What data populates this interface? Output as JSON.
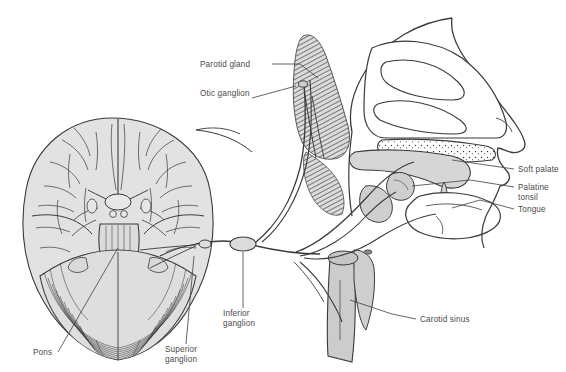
{
  "page": {
    "background_color": "#ffffff",
    "header": {
      "text": "hapter 18 / THE BRAIN AND THE CRANIAL NERVES",
      "color": "#3b3b3b",
      "clipped_left": true
    }
  },
  "figure": {
    "type": "anatomical-illustration",
    "style": "line drawing with gray tone fills and hatching",
    "colors": {
      "outline": "#3a3a3a",
      "brain_fill": "#e2e2e2",
      "tissue_fill": "#d6d6d6",
      "gland_hatch": "#6b6b6b",
      "vessel_fill": "#cccccc",
      "label_text": "#4a4a4a",
      "leader_line": "#4a4a4a"
    },
    "structures": [
      {
        "name": "brain-inferior-view",
        "region": "left"
      },
      {
        "name": "cerebral-hemispheres",
        "region": "left"
      },
      {
        "name": "brainstem",
        "region": "left"
      },
      {
        "name": "cerebellum",
        "region": "left"
      },
      {
        "name": "parotid-gland",
        "region": "center"
      },
      {
        "name": "nasal-cavity",
        "region": "right"
      },
      {
        "name": "nasal-conchae",
        "region": "right"
      },
      {
        "name": "hard-palate",
        "region": "right"
      },
      {
        "name": "soft-palate",
        "region": "right"
      },
      {
        "name": "tongue",
        "region": "right"
      },
      {
        "name": "palatine-tonsil",
        "region": "right"
      },
      {
        "name": "carotid-artery",
        "region": "center-bottom"
      },
      {
        "name": "glossopharyngeal-nerve",
        "region": "center"
      }
    ],
    "labels": [
      {
        "id": "parotid-gland",
        "text": "Parotid gland",
        "lines": [
          "Parotid gland"
        ],
        "x": 200,
        "y": 67,
        "anchor": "start",
        "leader": true
      },
      {
        "id": "otic-ganglion",
        "text": "Otic ganglion",
        "lines": [
          "Otic ganglion"
        ],
        "x": 200,
        "y": 96,
        "anchor": "start",
        "leader": true
      },
      {
        "id": "soft-palate",
        "text": "Soft palate",
        "lines": [
          "Soft palate"
        ],
        "x": 518,
        "y": 172,
        "anchor": "start",
        "leader": true
      },
      {
        "id": "palatine-tonsil",
        "text": "Palatine tonsil",
        "lines": [
          "Palatine",
          "tonsil"
        ],
        "x": 518,
        "y": 190,
        "anchor": "start",
        "leader": true
      },
      {
        "id": "tongue",
        "text": "Tongue",
        "lines": [
          "Tongue"
        ],
        "x": 518,
        "y": 212,
        "anchor": "start",
        "leader": true
      },
      {
        "id": "carotid-sinus",
        "text": "Carotid sinus",
        "lines": [
          "Carotid sinus"
        ],
        "x": 420,
        "y": 322,
        "anchor": "start",
        "leader": true
      },
      {
        "id": "inferior-ganglion",
        "text": "Inferior ganglion",
        "lines": [
          "Inferior",
          "ganglion"
        ],
        "x": 223,
        "y": 316,
        "anchor": "start",
        "leader": true
      },
      {
        "id": "superior-ganglion",
        "text": "Superior ganglion",
        "lines": [
          "Superior",
          "ganglion"
        ],
        "x": 165,
        "y": 352,
        "anchor": "start",
        "leader": true
      },
      {
        "id": "pons",
        "text": "Pons",
        "lines": [
          "Pons"
        ],
        "x": 33,
        "y": 355,
        "anchor": "start",
        "leader": true
      }
    ]
  }
}
